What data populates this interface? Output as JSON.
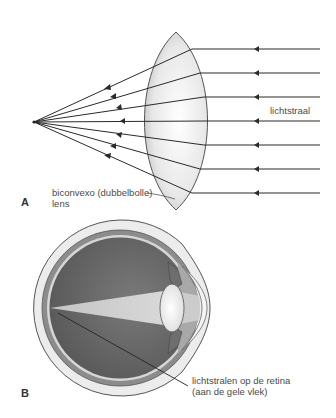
{
  "panel_a": {
    "label": "A",
    "ray_label": "lichtstraal",
    "lens_label_line1": "biconvexo (dubbelbolle)",
    "lens_label_line2": "lens",
    "ray_y_positions": [
      49,
      73,
      97,
      121,
      145,
      169,
      193
    ],
    "focal_point": [
      34,
      122
    ]
  },
  "panel_b": {
    "label": "B",
    "retina_label_line1": "lichtstralen op de retina",
    "retina_label_line2": "(aan de gele vlek)"
  },
  "colors": {
    "line": "#2a2a2a",
    "lens_fill": "#e6e6e6",
    "sclera": "#ececec",
    "choroid": "#8c8c8c",
    "vitreous": "#5e5e5e",
    "light_cone": "#c8c8c8",
    "text": "#4a4a4a"
  }
}
